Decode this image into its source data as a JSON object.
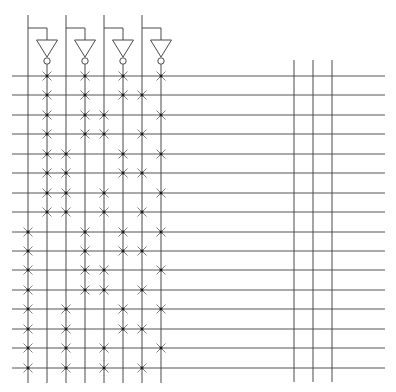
{
  "diagram": {
    "type": "pla-decoder-4to16",
    "colors": {
      "background": "#ffffff",
      "line": "#4a4a4a",
      "grid_line": "#555555",
      "cross": "#707070",
      "dot": "#1a1a1a"
    },
    "inverters": [
      {
        "input_x": 28,
        "output_x": 47
      },
      {
        "input_x": 66,
        "output_x": 85
      },
      {
        "input_x": 104,
        "output_x": 123
      },
      {
        "input_x": 142,
        "output_x": 161
      }
    ],
    "input_top_y": 15,
    "feedback_y": 28,
    "triangle_top_y": 40,
    "triangle_tip_y": 57,
    "triangle_half_width": 10.5,
    "bubble_cy": 61,
    "bubble_r": 3.2,
    "output_start_y": 64,
    "left_lines_bottom_y": 383,
    "row_x_start": 12,
    "row_x_end": 385,
    "rows_y": [
      76,
      95,
      115,
      134,
      154,
      173,
      193,
      212,
      232,
      251,
      270,
      290,
      309,
      329,
      348,
      368
    ],
    "right_verticals": {
      "xs": [
        294,
        313,
        332
      ],
      "top_y": 60,
      "bottom_y": 382
    },
    "columns_x": [
      28,
      47,
      66,
      85,
      104,
      123,
      142,
      161
    ],
    "crosspoints": [
      [
        1,
        3,
        5,
        7
      ],
      [
        1,
        3,
        5,
        6
      ],
      [
        1,
        3,
        4,
        7
      ],
      [
        1,
        3,
        4,
        6
      ],
      [
        1,
        2,
        5,
        7
      ],
      [
        1,
        2,
        5,
        6
      ],
      [
        1,
        2,
        4,
        7
      ],
      [
        1,
        2,
        4,
        6
      ],
      [
        0,
        3,
        5,
        7
      ],
      [
        0,
        3,
        5,
        6
      ],
      [
        0,
        3,
        4,
        7
      ],
      [
        0,
        3,
        4,
        6
      ],
      [
        0,
        2,
        5,
        7
      ],
      [
        0,
        2,
        5,
        6
      ],
      [
        0,
        2,
        4,
        7
      ],
      [
        0,
        2,
        4,
        6
      ]
    ],
    "cross_size": 4.5,
    "dot_size": 2.6
  }
}
